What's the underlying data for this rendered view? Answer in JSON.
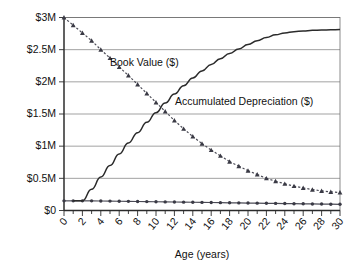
{
  "chart_data": {
    "type": "line",
    "title": "",
    "xlabel": "Age (years)",
    "ylabel": "",
    "xlim": [
      0,
      30
    ],
    "ylim": [
      0,
      3000000
    ],
    "grid": true,
    "legend_position": "inline-annotation",
    "x_ticks": [
      0,
      2,
      4,
      6,
      8,
      10,
      12,
      14,
      16,
      18,
      20,
      22,
      24,
      26,
      28,
      30
    ],
    "x_tick_labels": [
      "0",
      "2",
      "4",
      "6",
      "8",
      "10",
      "12",
      "14",
      "16",
      "18",
      "20",
      "22",
      "24",
      "26",
      "28",
      "30"
    ],
    "x_minor_tick_interval": 1,
    "y_ticks": [
      0,
      500000,
      1000000,
      1500000,
      2000000,
      2500000,
      3000000
    ],
    "y_tick_labels": [
      "$0",
      "$0.5M",
      "$1M",
      "$1.5M",
      "$2M",
      "$2.5M",
      "$3M"
    ],
    "x": [
      0,
      1,
      2,
      3,
      4,
      5,
      6,
      7,
      8,
      9,
      10,
      11,
      12,
      13,
      14,
      15,
      16,
      17,
      18,
      19,
      20,
      21,
      22,
      23,
      24,
      25,
      26,
      27,
      28,
      29,
      30
    ],
    "series": [
      {
        "name": "Book Value ($)",
        "style": "triangle-markers-dashed",
        "color": "#3a3a45",
        "annotation": "Book Value ($)",
        "values": [
          3000000,
          2880000,
          2760000,
          2640000,
          2500000,
          2370000,
          2230000,
          2100000,
          1960000,
          1820000,
          1680000,
          1540000,
          1400000,
          1270000,
          1150000,
          1040000,
          940000,
          850000,
          760000,
          690000,
          620000,
          560000,
          500000,
          455000,
          415000,
          380000,
          350000,
          325000,
          305000,
          290000,
          280000
        ]
      },
      {
        "name": "Accumulated Depreciation ($)",
        "style": "smooth-solid",
        "color": "#2b2b2b",
        "annotation": "Accumulated Depreciation ($)",
        "values": [
          0,
          150000,
          150000,
          330000,
          520000,
          700000,
          880000,
          1050000,
          1210000,
          1370000,
          1520000,
          1670000,
          1810000,
          1940000,
          2060000,
          2170000,
          2270000,
          2360000,
          2440000,
          2510000,
          2580000,
          2640000,
          2690000,
          2730000,
          2760000,
          2780000,
          2790000,
          2800000,
          2805000,
          2810000,
          2812000
        ]
      },
      {
        "name": "Salvage Value ($)",
        "style": "dot-markers-flat",
        "color": "#4a4a55",
        "annotation": "",
        "values": [
          150000,
          150000,
          150000,
          150000,
          148000,
          146000,
          144000,
          142000,
          140000,
          138000,
          136000,
          134000,
          132000,
          130000,
          128000,
          126000,
          124000,
          122000,
          120000,
          118000,
          116000,
          114000,
          112000,
          110000,
          108000,
          106000,
          104000,
          102000,
          100000,
          98000,
          96000
        ]
      }
    ],
    "annotations": [
      {
        "text": "Book Value ($)",
        "x_px": 110,
        "y_px": 62
      },
      {
        "text": "Accumulated Depreciation ($)",
        "x_px": 175,
        "y_px": 101
      }
    ]
  }
}
